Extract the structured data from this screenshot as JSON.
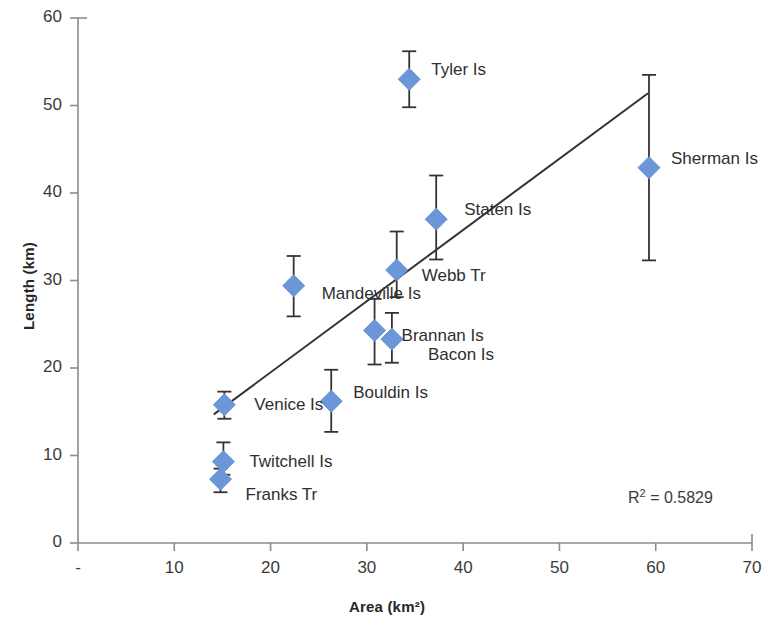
{
  "chart_data": {
    "type": "scatter",
    "title": "",
    "xlabel": "Area (km²)",
    "ylabel": "Length (km)",
    "xlim": [
      0,
      70
    ],
    "ylim": [
      0,
      60
    ],
    "xticks": [
      "-",
      "10",
      "20",
      "30",
      "40",
      "50",
      "60",
      "70"
    ],
    "xtick_values": [
      0,
      10,
      20,
      30,
      40,
      50,
      60,
      70
    ],
    "yticks": [
      "0",
      "10",
      "20",
      "30",
      "40",
      "50",
      "60"
    ],
    "ytick_values": [
      0,
      10,
      20,
      30,
      40,
      50,
      60
    ],
    "grid": false,
    "legend": "none",
    "marker_color": "#6b96d8",
    "marker_shape": "diamond",
    "errorbar_color": "#333333",
    "trendline_color": "#333333",
    "annotation": "R² = 0.5829",
    "r_squared": 0.5829,
    "trendline": {
      "x1": 14.1,
      "y1": 14.7,
      "x2": 59.2,
      "y2": 51.4
    },
    "points": [
      {
        "label": "Tyler Is",
        "x": 34.4,
        "y": 53.0,
        "yerr_low": 3.2,
        "yerr_high": 3.2,
        "label_dx": 22,
        "label_dy": -9
      },
      {
        "label": "Sherman Is",
        "x": 59.3,
        "y": 42.9,
        "yerr_low": 10.6,
        "yerr_high": 10.6,
        "label_dx": 22,
        "label_dy": -9
      },
      {
        "label": "Staten Is",
        "x": 37.2,
        "y": 37.0,
        "yerr_low": 4.6,
        "yerr_high": 5.0,
        "label_dx": 28,
        "label_dy": -9
      },
      {
        "label": "Webb Tr",
        "x": 33.1,
        "y": 31.2,
        "yerr_low": 3.1,
        "yerr_high": 4.4,
        "label_dx": 25,
        "label_dy": 6
      },
      {
        "label": "Mandeville Is",
        "x": 22.4,
        "y": 29.4,
        "yerr_low": 3.5,
        "yerr_high": 3.4,
        "label_dx": 28,
        "label_dy": 8
      },
      {
        "label": "Brannan Is",
        "x": 30.8,
        "y": 24.3,
        "yerr_low": 3.9,
        "yerr_high": 3.6,
        "label_dx": 27,
        "label_dy": 6
      },
      {
        "label": "Bacon Is",
        "x": 32.6,
        "y": 23.3,
        "yerr_low": 2.7,
        "yerr_high": 3.0,
        "label_dx": 36,
        "label_dy": 16
      },
      {
        "label": "Bouldin Is",
        "x": 26.3,
        "y": 16.2,
        "yerr_low": 3.5,
        "yerr_high": 3.6,
        "label_dx": 22,
        "label_dy": -8
      },
      {
        "label": "Venice Is",
        "x": 15.2,
        "y": 15.8,
        "yerr_low": 1.6,
        "yerr_high": 1.5,
        "label_dx": 30,
        "label_dy": 0
      },
      {
        "label": "Twitchell Is",
        "x": 15.1,
        "y": 9.3,
        "yerr_low": 1.5,
        "yerr_high": 2.2,
        "label_dx": 26,
        "label_dy": 0
      },
      {
        "label": "Franks Tr",
        "x": 14.8,
        "y": 7.3,
        "yerr_low": 1.5,
        "yerr_high": 1.2,
        "label_dx": 25,
        "label_dy": 16
      }
    ]
  }
}
